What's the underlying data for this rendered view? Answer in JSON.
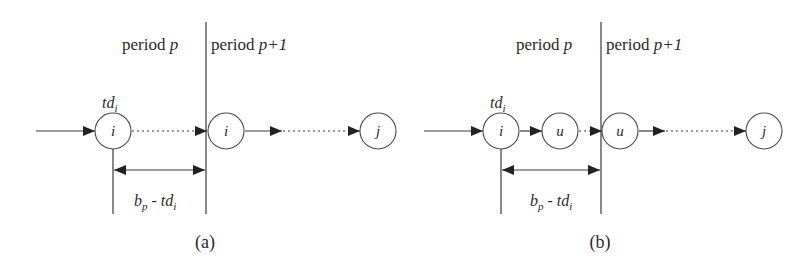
{
  "figure": {
    "panels": [
      {
        "id": "a",
        "caption": "(a)",
        "period_left": {
          "word": "period",
          "var": "p"
        },
        "period_right": {
          "word": "period",
          "var": "p+1"
        },
        "time_label": {
          "base": "td",
          "sub": "i"
        },
        "interval_label": {
          "b": "b",
          "b_sub": "p",
          "minus": "-",
          "td": "td",
          "td_sub": "i"
        },
        "nodes": [
          {
            "label": "i"
          },
          {
            "label": "i"
          },
          {
            "label": "j"
          }
        ]
      },
      {
        "id": "b",
        "caption": "(b)",
        "period_left": {
          "word": "period",
          "var": "p"
        },
        "period_right": {
          "word": "period",
          "var": "p+1"
        },
        "time_label": {
          "base": "td",
          "sub": "i"
        },
        "interval_label": {
          "b": "b",
          "b_sub": "p",
          "minus": "-",
          "td": "td",
          "td_sub": "i"
        },
        "nodes": [
          {
            "label": "i"
          },
          {
            "label": "u"
          },
          {
            "label": "u"
          },
          {
            "label": "j"
          }
        ]
      }
    ],
    "colors": {
      "stroke": "#3a3a3a",
      "arrowhead": "#222222",
      "text": "#2a2a2a"
    }
  }
}
